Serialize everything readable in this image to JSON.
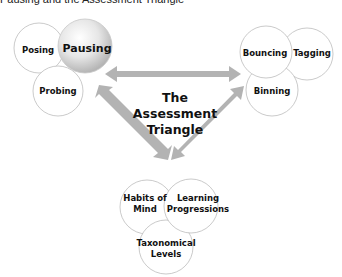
{
  "title": "Pausing and the Assessment Triangle",
  "center_label": [
    "The",
    "Assessment",
    "Triangle"
  ],
  "clusters": {
    "top_left": {
      "circles": [
        {
          "label": [
            "Posing"
          ],
          "highlighted": false
        },
        {
          "label": [
            "Pausing"
          ],
          "highlighted": true
        },
        {
          "label": [
            "Probing"
          ],
          "highlighted": false
        }
      ]
    },
    "top_right": {
      "circles": [
        {
          "label": [
            "Bouncing"
          ],
          "highlighted": false
        },
        {
          "label": [
            "Tagging"
          ],
          "highlighted": false
        },
        {
          "label": [
            "Binning"
          ],
          "highlighted": false
        }
      ]
    },
    "bottom": {
      "circles": [
        {
          "label": [
            "Habits of",
            "Mind"
          ],
          "highlighted": false
        },
        {
          "label": [
            "Learning",
            "Progressions"
          ],
          "highlighted": false
        },
        {
          "label": [
            "Taxonomical",
            "Levels"
          ],
          "highlighted": false
        }
      ]
    }
  },
  "colors": {
    "arrow": "#b3b3b3",
    "circle_stroke": "#bdbdbd",
    "highlight_light": "#ffffff",
    "highlight_dark": "#b8b8b8"
  }
}
